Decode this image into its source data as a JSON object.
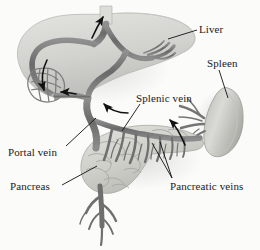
{
  "figure": {
    "background_color": "#fbfbfa",
    "label_color": "#1a1a1a",
    "vessel_color": "#6e6e6e",
    "organ_fill_color": "#d8d8d4"
  },
  "labels": {
    "liver": "Liver",
    "spleen": "Spleen",
    "splenic_vein": "Splenic vein",
    "portal_vein": "Portal vein",
    "pancreas": "Pancreas",
    "pancreatic_veins": "Pancreatic veins"
  },
  "structures": [
    {
      "name": "liver",
      "label": "Liver",
      "position": "upper-left"
    },
    {
      "name": "spleen",
      "label": "Spleen",
      "position": "right"
    },
    {
      "name": "pancreas",
      "label": "Pancreas",
      "position": "lower-center"
    },
    {
      "name": "portal-vein",
      "label": "Portal vein",
      "position": "center"
    },
    {
      "name": "splenic-vein",
      "label": "Splenic vein",
      "position": "center-right"
    },
    {
      "name": "pancreatic-veins",
      "label": "Pancreatic veins",
      "position": "lower-center-right"
    }
  ],
  "flow_arrows": [
    {
      "name": "arrow-vena-cava",
      "direction": "up",
      "location": "hepatic outflow at top"
    },
    {
      "name": "arrow-left-lobe-down",
      "direction": "down",
      "location": "left hepatic lobe"
    },
    {
      "name": "arrow-left-lobe-inflow",
      "direction": "left",
      "location": "left portal branch"
    },
    {
      "name": "arrow-portal-inflow",
      "direction": "up-left",
      "location": "portal vein confluence"
    },
    {
      "name": "arrow-splenic-flow",
      "direction": "up-left",
      "location": "splenic vein toward portal"
    }
  ]
}
